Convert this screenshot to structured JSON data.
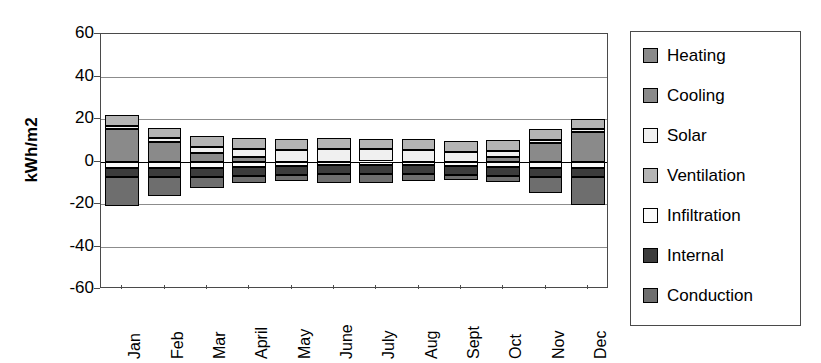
{
  "chart_data": {
    "type": "bar",
    "subtype": "stacked-bar-positive-negative",
    "title": "",
    "xlabel": "",
    "ylabel": "kWh/m2",
    "ylim": [
      -60,
      60
    ],
    "yticks": [
      60,
      40,
      20,
      0,
      -20,
      -40,
      -60
    ],
    "ytick_labels": [
      "60",
      "40",
      "20",
      "0",
      "-20",
      "-40",
      "-60"
    ],
    "grid": true,
    "legend_position": "right",
    "categories": [
      "Jan",
      "Feb",
      "Mar",
      "April",
      "May",
      "June",
      "July",
      "Aug",
      "Sept",
      "Oct",
      "Nov",
      "Dec"
    ],
    "series": [
      {
        "name": "Heating",
        "color": "#8a8a8a",
        "values": [
          15.5,
          9.0,
          4.0,
          2.0,
          0.0,
          0.0,
          0.0,
          0.0,
          0.0,
          2.0,
          8.5,
          14.0
        ]
      },
      {
        "name": "Cooling",
        "color": "#8a8a8a",
        "values": [
          0.0,
          0.0,
          0.0,
          0.0,
          0.0,
          0.0,
          0.0,
          0.0,
          0.0,
          0.0,
          0.0,
          0.0
        ]
      },
      {
        "name": "Solar",
        "color": "#f0f0f0",
        "values": [
          1.2,
          2.0,
          3.0,
          4.0,
          5.5,
          6.0,
          5.8,
          5.5,
          4.5,
          3.0,
          1.8,
          1.2
        ]
      },
      {
        "name": "Ventilation",
        "color": "#b4b4b4",
        "values": [
          5.0,
          5.0,
          5.0,
          5.0,
          5.0,
          5.0,
          5.0,
          5.0,
          5.0,
          5.0,
          5.0,
          5.0
        ]
      },
      {
        "name": "Infiltration",
        "color": "#fafafa",
        "values": [
          -3.0,
          -3.0,
          -3.0,
          -2.5,
          -2.0,
          -1.5,
          -1.5,
          -1.5,
          -2.0,
          -2.5,
          -3.0,
          -3.0
        ]
      },
      {
        "name": "Internal",
        "color": "#3c3c3c",
        "values": [
          -4.5,
          -4.5,
          -4.5,
          -4.5,
          -4.5,
          -4.5,
          -4.5,
          -4.5,
          -4.5,
          -4.5,
          -4.5,
          -4.5
        ]
      },
      {
        "name": "Conduction",
        "color": "#6e6e6e",
        "values": [
          -13.5,
          -8.5,
          -5.0,
          -3.0,
          -2.5,
          -4.0,
          -4.0,
          -3.0,
          -2.0,
          -2.5,
          -7.5,
          -13.0
        ]
      }
    ],
    "stack_positive_totals": [
      21.7,
      16.0,
      12.0,
      11.0,
      10.5,
      11.0,
      10.8,
      10.5,
      9.5,
      10.0,
      15.3,
      20.2
    ],
    "stack_negative_totals": [
      -21.0,
      -16.0,
      -12.5,
      -10.0,
      -9.0,
      -10.0,
      -10.0,
      -9.0,
      -8.5,
      -9.5,
      -15.0,
      -20.5
    ]
  },
  "legend": {
    "items": [
      {
        "label": "Heating",
        "swatch": "#8a8a8a"
      },
      {
        "label": "Cooling",
        "swatch": "#8a8a8a"
      },
      {
        "label": "Solar",
        "swatch": "#f0f0f0"
      },
      {
        "label": "Ventilation",
        "swatch": "#b4b4b4"
      },
      {
        "label": "Infiltration",
        "swatch": "#fafafa"
      },
      {
        "label": "Internal",
        "swatch": "#3c3c3c"
      },
      {
        "label": "Conduction",
        "swatch": "#6e6e6e"
      }
    ]
  },
  "axes": {
    "y_title": "kWh/m2"
  }
}
